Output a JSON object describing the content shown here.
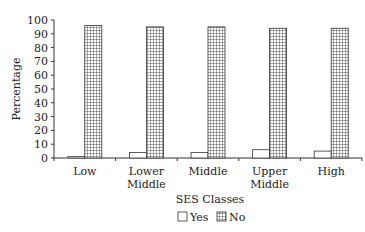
{
  "chart_data": {
    "type": "bar",
    "title": "",
    "xlabel": "SES Classes",
    "ylabel": "Percentage",
    "categories": [
      "Low",
      "Lower Middle",
      "Middle",
      "Upper Middle",
      "High"
    ],
    "category_lines": [
      [
        "Low"
      ],
      [
        "Lower",
        "Middle"
      ],
      [
        "Middle"
      ],
      [
        "Upper",
        "Middle"
      ],
      [
        "High"
      ]
    ],
    "series": [
      {
        "name": "Yes",
        "values": [
          1,
          4,
          4,
          6,
          5
        ],
        "pattern": "none"
      },
      {
        "name": "No",
        "values": [
          96,
          95,
          95,
          94,
          94
        ],
        "pattern": "grid"
      }
    ],
    "ylim": [
      0,
      100
    ],
    "yticks": [
      0,
      10,
      20,
      30,
      40,
      50,
      60,
      70,
      80,
      90,
      100
    ],
    "grid": false,
    "legend_position": "bottom"
  }
}
